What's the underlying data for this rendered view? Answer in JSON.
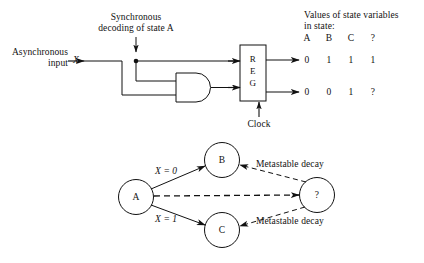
{
  "figure": {
    "title_region": {
      "table_heading_line1": "Values of state variables",
      "table_heading_line2": "in state:"
    },
    "labels": {
      "async_line1": "Asynchronous",
      "async_line2": "input",
      "async_signal": "X",
      "sync_line1": "Synchronous",
      "sync_line2": "decoding of state A",
      "clock": "Clock"
    },
    "register": {
      "letters": [
        "R",
        "E",
        "G"
      ]
    },
    "state_table": {
      "headers": [
        "A",
        "B",
        "C",
        "?"
      ],
      "rows": [
        [
          "0",
          "1",
          "1",
          "1"
        ],
        [
          "0",
          "0",
          "1",
          "?"
        ]
      ]
    },
    "state_diagram": {
      "nodes": [
        {
          "id": "A",
          "label": "A"
        },
        {
          "id": "B",
          "label": "B"
        },
        {
          "id": "C",
          "label": "C"
        },
        {
          "id": "Q",
          "label": "?"
        }
      ],
      "edge_labels": {
        "a_to_b": "X = 0",
        "a_to_c": "X = 1",
        "q_to_b": "Metastable decay",
        "q_to_c": "Metastable decay"
      }
    },
    "colors": {
      "ink": "#111111",
      "background": "#ffffff",
      "dashed": "#4a4a4a"
    }
  }
}
